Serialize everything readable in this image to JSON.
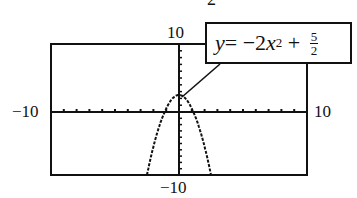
{
  "top_fragment": "2",
  "labels": {
    "ymax": "10",
    "ymin": "−10",
    "xmin": "−10",
    "xmax": "10"
  },
  "callout": {
    "y": "y",
    "eq": " = −2",
    "x": "x",
    "exp": "2",
    "plus": " + ",
    "frac_num": "5",
    "frac_den": "2"
  },
  "chart_data": {
    "type": "line",
    "title": "",
    "function": "y = -2x^2 + 5/2",
    "xlim": [
      -10,
      10
    ],
    "ylim": [
      -10,
      10
    ],
    "xscale": 1,
    "yscale": 1,
    "grid": false,
    "tick_labels": {
      "x": [
        "-10",
        "10"
      ],
      "y": [
        "-10",
        "10"
      ]
    },
    "series": [
      {
        "name": "y = -2x^2 + 5/2",
        "x": [
          -2.5,
          -2,
          -1.5,
          -1.118,
          -1,
          -0.5,
          0,
          0.5,
          1,
          1.118,
          1.5,
          2,
          2.5
        ],
        "y": [
          -10,
          -5.5,
          -2,
          0,
          0.5,
          2,
          2.5,
          2,
          0.5,
          0,
          -2,
          -5.5,
          -10
        ]
      }
    ],
    "annotations": [
      {
        "text": "y = -2x^2 + 5/2",
        "points_to": [
          0,
          2.5
        ]
      }
    ]
  }
}
